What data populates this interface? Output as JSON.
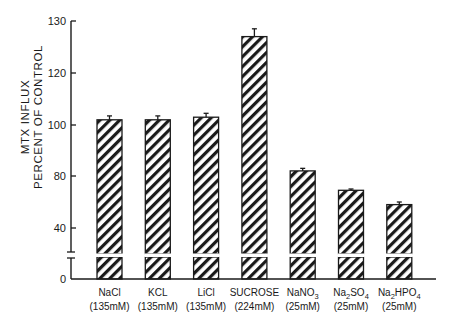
{
  "chart_data": {
    "type": "bar",
    "title": "",
    "xlabel": "",
    "ylabel": "MTX INFLUX PERCENT OF CONTROL",
    "ylabel_lines": [
      "MTX INFLUX",
      "PERCENT OF CONTROL"
    ],
    "yticks": [
      0,
      40,
      80,
      100,
      120,
      130
    ],
    "ylim": [
      0,
      130
    ],
    "axis_break": true,
    "grid": false,
    "legend": null,
    "categories": [
      "NaCl (135mM)",
      "KCL (135mM)",
      "LiCl (135mM)",
      "SUCROSE (224mM)",
      "NaNO3 (25mM)",
      "Na2SO4 (25mM)",
      "Na2HPO4 (25mM)"
    ],
    "category_labels": [
      {
        "name": "NaCl",
        "conc": "(135mM)"
      },
      {
        "name": "KCL",
        "conc": "(135mM)"
      },
      {
        "name": "LiCl",
        "conc": "(135mM)"
      },
      {
        "name": "SUCROSE",
        "conc": "(224mM)"
      },
      {
        "name": "NaNO3",
        "conc": "(25mM)"
      },
      {
        "name": "Na2SO4",
        "conc": "(25mM)"
      },
      {
        "name": "Na2HPO4",
        "conc": "(25mM)"
      }
    ],
    "values": [
      102,
      102,
      103,
      127,
      82,
      69,
      58
    ],
    "errors": [
      1.5,
      1.5,
      1.5,
      1.5,
      1,
      1,
      2
    ],
    "bar_fill": "diagonal-hatch",
    "colors": {
      "ink": "#1a1a1a",
      "background": "#ffffff"
    }
  }
}
